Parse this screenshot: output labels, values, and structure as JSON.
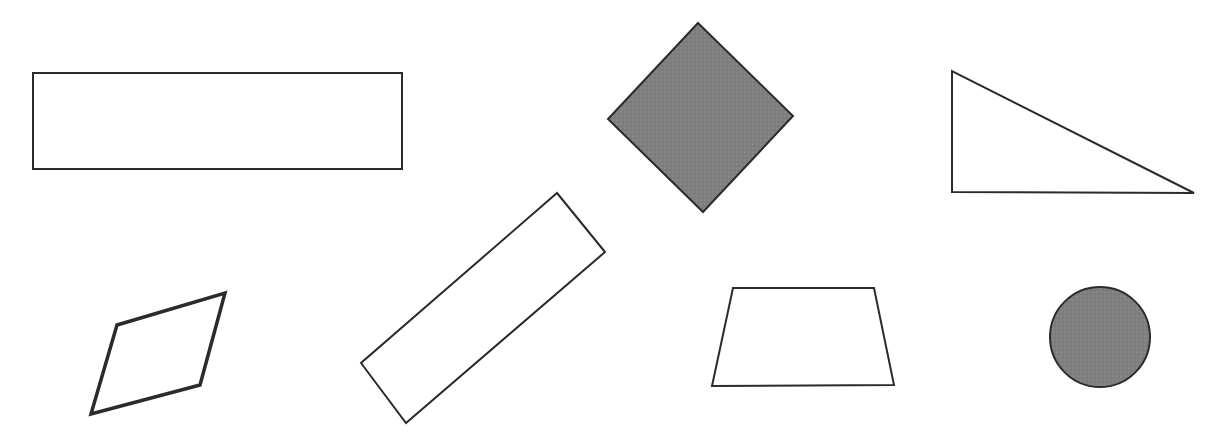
{
  "canvas": {
    "width": 1222,
    "height": 433,
    "background_color": "#FFFFFF",
    "title": "Geometric shapes figure"
  },
  "style": {
    "outline_color": "#2B2B2B",
    "fill_gray": "#808080",
    "fill_none": "none",
    "stroke_thin": 2,
    "stroke_thick": 3.5
  },
  "shapes": [
    {
      "id": "rectangle-wide",
      "name": "wide-rectangle",
      "type": "rectangle",
      "fill": "none",
      "stroke": "#2B2B2B",
      "stroke_width": 2,
      "points": "33,73 402,73 402,169 33,169",
      "bbox": [
        33,
        73,
        369,
        96
      ]
    },
    {
      "id": "diamond-filled",
      "name": "filled-diamond",
      "type": "diamond",
      "fill": "#808080",
      "stroke": "#2B2B2B",
      "stroke_width": 2,
      "points": "698,23 793,116 703,212 608,119",
      "bbox": [
        608,
        23,
        185,
        189
      ]
    },
    {
      "id": "triangle-right",
      "name": "right-triangle",
      "type": "triangle",
      "fill": "none",
      "stroke": "#2B2B2B",
      "stroke_width": 2,
      "points": "952,71 952,192 1194,193",
      "bbox": [
        952,
        71,
        242,
        122
      ]
    },
    {
      "id": "parallelogram-bottom-left",
      "name": "parallelogram",
      "type": "parallelogram",
      "fill": "none",
      "stroke": "#2B2B2B",
      "stroke_width": 3.5,
      "points": "225,293 200,385 91,414 117,325",
      "bbox": [
        91,
        293,
        134,
        121
      ]
    },
    {
      "id": "rectangle-tilted",
      "name": "tilted-rectangle",
      "type": "rectangle",
      "fill": "none",
      "stroke": "#2B2B2B",
      "stroke_width": 2,
      "points": "557,193 605,252 406,423 361,363",
      "bbox": [
        361,
        193,
        244,
        230
      ]
    },
    {
      "id": "trapezoid",
      "name": "trapezoid",
      "type": "trapezoid",
      "fill": "none",
      "stroke": "#2B2B2B",
      "stroke_width": 2,
      "points": "733,288 874,288 894,385 712,386",
      "bbox": [
        712,
        288,
        182,
        98
      ]
    },
    {
      "id": "circle-filled",
      "name": "filled-circle",
      "type": "circle",
      "fill": "#808080",
      "stroke": "#2B2B2B",
      "stroke_width": 2,
      "cx": 1100,
      "cy": 337,
      "r": 50,
      "bbox": [
        1050,
        287,
        100,
        100
      ]
    }
  ]
}
